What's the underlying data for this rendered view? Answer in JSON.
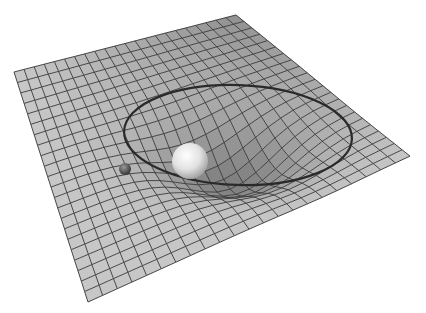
{
  "figure": {
    "background_color": "#ffffff",
    "grid": {
      "rows": 22,
      "cols": 22,
      "line_color": "#3a3a3a",
      "cell_color_light": "#c8c8c8",
      "cell_color_dark": "#8a8a8a",
      "corners": {
        "left": [
          14,
          72
        ],
        "top": [
          236,
          15
        ],
        "right": [
          410,
          156
        ],
        "bottom": [
          88,
          302
        ]
      }
    },
    "well": {
      "center": [
        230,
        150
      ],
      "depth": 38,
      "radius": 120
    },
    "orbit": {
      "cx": 238,
      "cy": 135,
      "rx": 114,
      "ry": 50,
      "rotation": 2,
      "color": "#2a2a2a",
      "stroke_width": 2.2
    },
    "large_mass": {
      "cx": 190,
      "cy": 161,
      "r": 18,
      "color_light": "#f2f2f2",
      "color_dark": "#9a9a9a"
    },
    "small_mass": {
      "cx": 125,
      "cy": 169,
      "r": 6,
      "color_light": "#8a8a8a",
      "color_dark": "#2e2e2e"
    }
  }
}
